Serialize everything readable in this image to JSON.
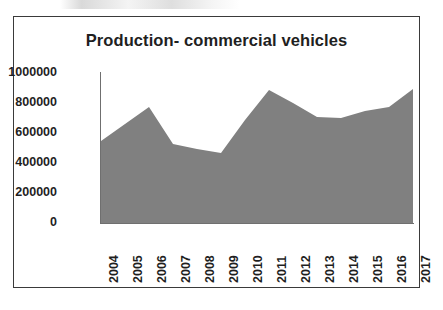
{
  "chart_data": {
    "type": "area",
    "title": "Production- commercial vehicles",
    "xlabel": "",
    "ylabel": "",
    "categories": [
      "2004",
      "2005",
      "2006",
      "2007",
      "2008",
      "2009",
      "2010",
      "2011",
      "2012",
      "2013",
      "2014",
      "2015",
      "2016",
      "2017"
    ],
    "values": [
      547000,
      660000,
      773000,
      527000,
      493000,
      467000,
      687000,
      887000,
      800000,
      707000,
      700000,
      747000,
      773000,
      893000
    ],
    "series": [
      {
        "name": "Production- commercial vehicles",
        "values": [
          547000,
          660000,
          773000,
          527000,
          493000,
          467000,
          687000,
          887000,
          800000,
          707000,
          700000,
          747000,
          773000,
          893000
        ]
      }
    ],
    "ylim": [
      0,
      1000000
    ],
    "yticks": [
      0,
      200000,
      400000,
      600000,
      800000,
      1000000
    ],
    "ytick_labels": [
      "0",
      "200000",
      "400000",
      "600000",
      "800000",
      "1000000"
    ],
    "xtick_labels": [
      "2004",
      "2005",
      "2006",
      "2007",
      "2008",
      "2009",
      "2010",
      "2011",
      "2012",
      "2013",
      "2014",
      "2015",
      "2016",
      "2017"
    ],
    "grid": false,
    "legend": false,
    "legend_position": "none",
    "colors": {
      "area_fill": "#808080",
      "axis": "#6f6f6f",
      "text": "#1f1f1f",
      "frame_border": "#3a3a3a",
      "background": "#ffffff"
    }
  }
}
